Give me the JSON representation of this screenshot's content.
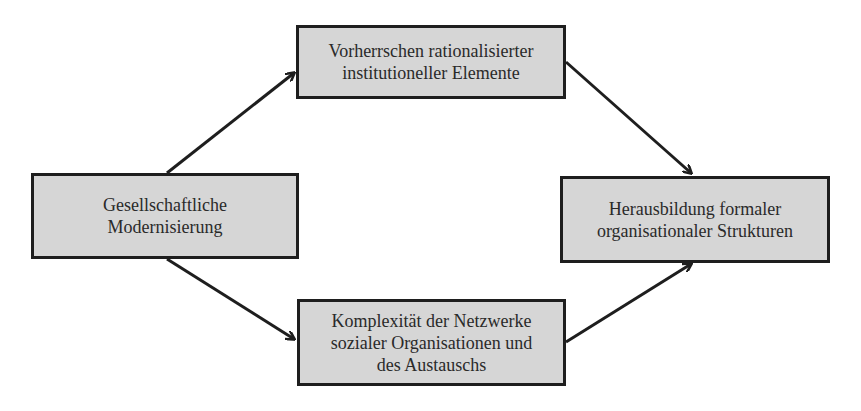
{
  "diagram": {
    "type": "flow",
    "nodes": [
      {
        "id": "modernisierung",
        "label": "Gesellschaftliche\nModernisierung"
      },
      {
        "id": "vorherrschen",
        "label": "Vorherrschen rationalisierter\ninstitutioneller Elemente"
      },
      {
        "id": "komplexitaet",
        "label": "Komplexität der Netzwerke\nsozialer Organisationen und\ndes Austauschs"
      },
      {
        "id": "herausbildung",
        "label": "Herausbildung formaler\norganisationaler Strukturen"
      }
    ],
    "edges": [
      {
        "from": "modernisierung",
        "to": "vorherrschen"
      },
      {
        "from": "modernisierung",
        "to": "komplexitaet"
      },
      {
        "from": "vorherrschen",
        "to": "herausbildung"
      },
      {
        "from": "komplexitaet",
        "to": "herausbildung"
      }
    ]
  },
  "colors": {
    "box_fill": "#d6d6d6",
    "box_border": "#1e1e1e",
    "arrow": "#1e1e1e",
    "text": "#2a2a2a",
    "background": "#ffffff"
  }
}
